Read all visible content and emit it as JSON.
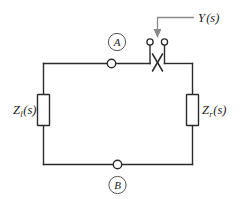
{
  "figure": {
    "background_color": "#ffffff",
    "wire_color": "#2b2b2b",
    "leader_color": "#8a8a8a",
    "text_color": "#1a1a1a"
  },
  "labels": {
    "impedance_left": {
      "symbol": "Z",
      "subscript": "l",
      "argument": "(s)",
      "full_text": "Z_l(s)"
    },
    "impedance_right": {
      "symbol": "Z",
      "subscript": "r",
      "argument": "(s)",
      "full_text": "Z_r(s)"
    },
    "admittance": {
      "symbol": "Y",
      "argument": "(s)",
      "full_text": "Y(s)"
    },
    "node_a": "A",
    "node_b": "B"
  },
  "elements": {
    "left_impedance_box": {
      "name": "resistor box left"
    },
    "right_impedance_box": {
      "name": "resistor box right"
    },
    "node_a_terminal": {
      "name": "open circle node on top wire"
    },
    "node_b_terminal": {
      "name": "open circle node on bottom wire"
    },
    "switch_terminal_left": {
      "name": "open circle terminal left"
    },
    "switch_terminal_right": {
      "name": "open circle terminal right"
    },
    "crossing_x": {
      "name": "crossed switch element"
    },
    "leader_arrow": {
      "name": "arrow pointing down to switch"
    }
  },
  "icons": {
    "arrow": "arrow-down-icon",
    "node": "circle-node-icon",
    "terminal": "open-terminal-icon",
    "cross": "cross-x-icon"
  }
}
